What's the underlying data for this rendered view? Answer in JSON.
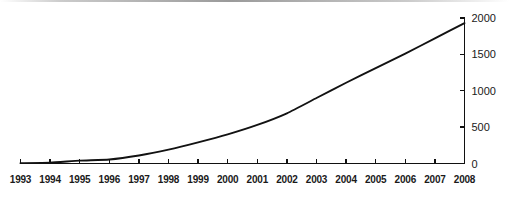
{
  "chart_data": {
    "type": "line",
    "title": "",
    "subtitle": "",
    "xlabel": "",
    "ylabel": "",
    "legend": [],
    "legend_position": "none",
    "grid": false,
    "y_axis_side": "right",
    "x": [
      "1993",
      "1994",
      "1995",
      "1996",
      "1997",
      "1998",
      "1999",
      "2000",
      "2001",
      "2002",
      "2003",
      "2004",
      "2005",
      "2006",
      "2007",
      "2008"
    ],
    "categories": [
      "1993",
      "1994",
      "1995",
      "1996",
      "1997",
      "1998",
      "1999",
      "2000",
      "2001",
      "2002",
      "2003",
      "2004",
      "2005",
      "2006",
      "2007",
      "2008"
    ],
    "values": [
      5,
      10,
      40,
      55,
      110,
      190,
      290,
      400,
      530,
      690,
      900,
      1110,
      1310,
      1510,
      1720,
      1930
    ],
    "series": [
      {
        "name": "",
        "values": [
          5,
          10,
          40,
          55,
          110,
          190,
          290,
          400,
          530,
          690,
          900,
          1110,
          1310,
          1510,
          1720,
          1930
        ]
      }
    ],
    "xlim": [
      "1993",
      "2008"
    ],
    "ylim": [
      0,
      2000
    ],
    "ytick_values": [
      0,
      500,
      1000,
      1500,
      2000
    ],
    "ytick_labels": [
      "0",
      "500",
      "1000",
      "1500",
      "2000"
    ],
    "xtick_labels": [
      "1993",
      "1994",
      "1995",
      "1996",
      "1997",
      "1998",
      "1999",
      "2000",
      "2001",
      "2002",
      "2003",
      "2004",
      "2005",
      "2006",
      "2007",
      "2008"
    ],
    "line_color": "#121212",
    "axis_color": "#111111",
    "background_color": "#ffffff",
    "annotations": []
  }
}
